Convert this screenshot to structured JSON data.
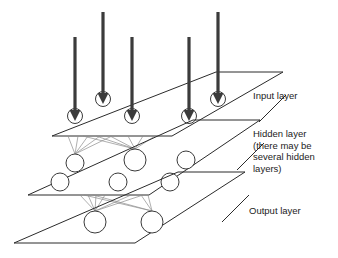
{
  "diagram": {
    "background_color": "#ffffff",
    "line_color": "#2b2b2b",
    "synapse_color": "#8d8d8d",
    "arrow_color": "#3b3b3b",
    "node_fill": "#ffffff"
  },
  "labels": {
    "input": "Input layer",
    "hidden_line1": "Hidden layer",
    "hidden_line2": "(there may be",
    "hidden_line3": "several hidden",
    "hidden_line4": "layers)",
    "output": "Output layer"
  },
  "layers": [
    {
      "id": "input-layer",
      "name": "Input layer",
      "node_count": 5,
      "plane": "216,72 283,72 172,136 52,136",
      "nodes": [
        {
          "cx": 103,
          "cy": 99,
          "r": 7.5,
          "row": "back"
        },
        {
          "cx": 161,
          "cy": 99,
          "r": 7.5,
          "row": "back"
        },
        {
          "cx": 218,
          "cy": 99,
          "r": 7.5,
          "row": "back"
        },
        {
          "cx": 75,
          "cy": 116,
          "r": 7.5,
          "row": "front"
        },
        {
          "cx": 132,
          "cy": 116,
          "r": 7.5,
          "row": "front"
        },
        {
          "cx": 189,
          "cy": 116,
          "r": 7.5,
          "row": "front"
        }
      ]
    },
    {
      "id": "hidden-layer",
      "name": "Hidden layer",
      "node_count": 6,
      "plane": "193,120 260,120 149,195 28,195",
      "nodes": [
        {
          "cx": 75,
          "cy": 163,
          "r": 9,
          "row": "back"
        },
        {
          "cx": 135,
          "cy": 160,
          "r": 11,
          "row": "back"
        },
        {
          "cx": 186,
          "cy": 160,
          "r": 9,
          "row": "back"
        },
        {
          "cx": 60,
          "cy": 182,
          "r": 9,
          "row": "front"
        },
        {
          "cx": 118,
          "cy": 182,
          "r": 9,
          "row": "front"
        },
        {
          "cx": 170,
          "cy": 182,
          "r": 9,
          "row": "front"
        }
      ]
    },
    {
      "id": "output-layer",
      "name": "Output layer",
      "node_count": 2,
      "plane": "178,172 245,172 135,243 14,243",
      "nodes": [
        {
          "cx": 95,
          "cy": 222,
          "r": 11,
          "row": "front"
        },
        {
          "cx": 152,
          "cy": 222,
          "r": 11,
          "row": "front"
        }
      ]
    }
  ],
  "arrows": [
    {
      "id": "arrow-1",
      "x": 103,
      "y_top": 12,
      "y_tip": 99
    },
    {
      "id": "arrow-2",
      "x": 218,
      "y_top": 12,
      "y_tip": 99
    },
    {
      "id": "arrow-3",
      "x": 75,
      "y_top": 37,
      "y_tip": 116
    },
    {
      "id": "arrow-4",
      "x": 132,
      "y_top": 37,
      "y_tip": 116
    },
    {
      "id": "arrow-5",
      "x": 189,
      "y_top": 37,
      "y_tip": 116
    }
  ],
  "leader_lines": [
    {
      "id": "input-leader",
      "d": "M 259 122 L 286 95"
    },
    {
      "id": "hidden-leader",
      "d": "M 237 170 L 264 143"
    },
    {
      "id": "output-leader",
      "d": "M 222 222 L 249 195"
    }
  ],
  "label_positions": {
    "input": {
      "x": 253,
      "y": 99
    },
    "hidden": {
      "x": 253,
      "y": 139
    },
    "output": {
      "x": 249,
      "y": 214
    },
    "hidden_line_height": 11.5
  }
}
